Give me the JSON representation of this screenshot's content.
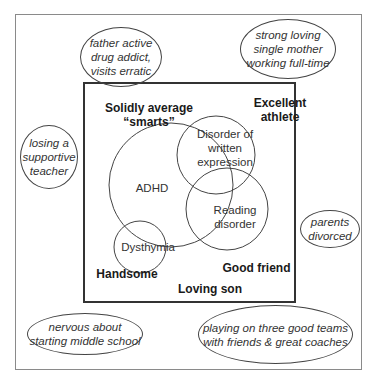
{
  "diagram": {
    "outer_context": [
      {
        "id": "father",
        "text": "father active\ndrug addict,\nvisits erratic"
      },
      {
        "id": "mother",
        "text": "strong loving\nsingle mother\nworking full-time"
      },
      {
        "id": "teacher",
        "text": "losing a\nsupportive\nteacher"
      },
      {
        "id": "divorce",
        "text": "parents\ndivorced"
      },
      {
        "id": "middle-school",
        "text": "nervous about\nstarting middle school"
      },
      {
        "id": "teams",
        "text": "playing on three good teams\nwith friends & great coaches"
      }
    ],
    "strengths": [
      {
        "id": "smarts",
        "text": "Solidly average\n“smarts”"
      },
      {
        "id": "athlete",
        "text": "Excellent\nathlete"
      },
      {
        "id": "handsome",
        "text": "Handsome"
      },
      {
        "id": "good-friend",
        "text": "Good friend"
      },
      {
        "id": "loving-son",
        "text": "Loving son"
      }
    ],
    "conditions": [
      {
        "id": "adhd",
        "text": "ADHD"
      },
      {
        "id": "written",
        "text": "Disorder of\nwritten\nexpression"
      },
      {
        "id": "reading",
        "text": "Reading\ndisorder"
      },
      {
        "id": "dysthymia",
        "text": "Dysthymia"
      }
    ]
  }
}
